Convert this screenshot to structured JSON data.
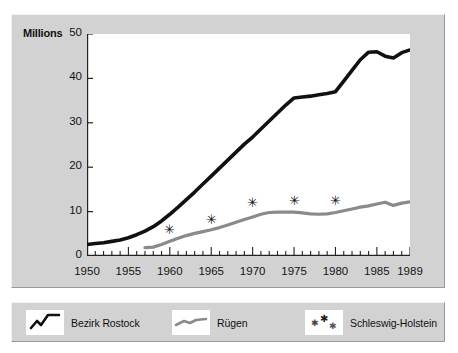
{
  "figure": {
    "background": "#ffffff",
    "panel_color": "#d2d2d2",
    "plot_color": "#ffffff"
  },
  "axis": {
    "unit_label": "Millions",
    "y_ticks": [
      "0",
      "10",
      "20",
      "30",
      "40",
      "50"
    ],
    "x_ticks": [
      "1950",
      "1955",
      "1960",
      "1965",
      "1970",
      "1975",
      "1980",
      "1985",
      "1989"
    ]
  },
  "legend": {
    "items": [
      {
        "label": "Bezirk Rostock",
        "color": "#111111",
        "marker": "line"
      },
      {
        "label": "Rügen",
        "color": "#8a8a8a",
        "marker": "line"
      },
      {
        "label": "Schleswig-Holstein",
        "color": "#111111",
        "marker": "asterisk"
      }
    ]
  },
  "chart_data": {
    "type": "line",
    "title": "",
    "subtitle": "",
    "xlabel": "",
    "ylabel": "Millions",
    "xlim": [
      1950,
      1989
    ],
    "ylim": [
      0,
      50
    ],
    "grid": false,
    "legend_position": "below",
    "x_tick_labels": [
      "1950",
      "1955",
      "1960",
      "1965",
      "1970",
      "1975",
      "1980",
      "1985",
      "1989"
    ],
    "y_tick_labels": [
      "0",
      "10",
      "20",
      "30",
      "40",
      "50"
    ],
    "minor_ticks": "every year on x-axis",
    "series": [
      {
        "name": "Bezirk Rostock",
        "color": "#111111",
        "style": "thick-solid-line",
        "x": [
          1950,
          1951,
          1952,
          1953,
          1954,
          1955,
          1956,
          1957,
          1958,
          1959,
          1960,
          1961,
          1962,
          1963,
          1964,
          1965,
          1966,
          1967,
          1968,
          1969,
          1970,
          1971,
          1972,
          1973,
          1974,
          1975,
          1976,
          1977,
          1978,
          1979,
          1980,
          1981,
          1982,
          1983,
          1984,
          1985,
          1986,
          1987,
          1988,
          1989
        ],
        "values": [
          2.6,
          2.8,
          3.0,
          3.3,
          3.6,
          4.1,
          4.8,
          5.6,
          6.6,
          7.9,
          9.4,
          11.0,
          12.7,
          14.4,
          16.2,
          18.0,
          19.8,
          21.6,
          23.4,
          25.2,
          26.8,
          28.6,
          30.4,
          32.2,
          34.0,
          35.6,
          35.8,
          36.0,
          36.3,
          36.6,
          37.0,
          39.4,
          41.8,
          44.2,
          45.9,
          46.0,
          45.0,
          44.6,
          45.8,
          46.4
        ]
      },
      {
        "name": "Rügen",
        "color": "#8a8a8a",
        "style": "thick-solid-line",
        "x": [
          1957,
          1958,
          1959,
          1960,
          1961,
          1962,
          1963,
          1964,
          1965,
          1966,
          1967,
          1968,
          1969,
          1970,
          1971,
          1972,
          1973,
          1974,
          1975,
          1976,
          1977,
          1978,
          1979,
          1980,
          1981,
          1982,
          1983,
          1984,
          1985,
          1986,
          1987,
          1988,
          1989
        ],
        "values": [
          1.9,
          2.0,
          2.6,
          3.3,
          4.0,
          4.6,
          5.1,
          5.5,
          5.9,
          6.4,
          7.0,
          7.6,
          8.2,
          8.8,
          9.4,
          9.8,
          9.9,
          9.9,
          9.9,
          9.7,
          9.5,
          9.4,
          9.5,
          9.8,
          10.2,
          10.6,
          11.0,
          11.3,
          11.7,
          12.1,
          11.4,
          11.9,
          12.2
        ]
      },
      {
        "name": "Schleswig-Holstein",
        "color": "#111111",
        "style": "asterisk-markers",
        "x": [
          1960,
          1965,
          1970,
          1975,
          1980
        ],
        "values": [
          6.0,
          8.2,
          12.0,
          12.6,
          12.4
        ]
      }
    ]
  }
}
